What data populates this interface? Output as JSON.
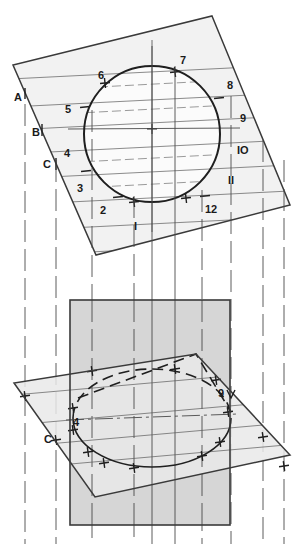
{
  "drawing": {
    "title": "Circle on inclined plane projected to ellipse",
    "canvas": {
      "width": 304,
      "height": 544
    },
    "colors": {
      "outline": "#3a3a3a",
      "thin_line": "#555555",
      "curve": "#222222",
      "fill_light": "#f0f0f0",
      "fill_mid": "#d6d6d6",
      "fill_pale": "#e8e8e8",
      "text": "#1a1a1a",
      "background": "#ffffff"
    },
    "top_view": {
      "name": "inclined-plane-with-circle",
      "plane_vertices": "212,16 290,205 96,255 13,65",
      "circle": {
        "cx": 152,
        "cy": 134,
        "r": 68
      },
      "division_point_labels": [
        {
          "id": "1",
          "text": "I",
          "x": 134,
          "y": 230
        },
        {
          "id": "2",
          "text": "2",
          "x": 100,
          "y": 214
        },
        {
          "id": "3",
          "text": "3",
          "x": 77,
          "y": 192
        },
        {
          "id": "4",
          "text": "4",
          "x": 64,
          "y": 157
        },
        {
          "id": "5",
          "text": "5",
          "x": 65,
          "y": 113
        },
        {
          "id": "6",
          "text": "6",
          "x": 98,
          "y": 79
        },
        {
          "id": "7",
          "text": "7",
          "x": 180,
          "y": 64
        },
        {
          "id": "8",
          "text": "8",
          "x": 227,
          "y": 89
        },
        {
          "id": "9",
          "text": "9",
          "x": 240,
          "y": 122
        },
        {
          "id": "10",
          "text": "IO",
          "x": 237,
          "y": 154
        },
        {
          "id": "11",
          "text": "II",
          "x": 228,
          "y": 184
        },
        {
          "id": "12",
          "text": "12",
          "x": 205,
          "y": 213
        }
      ],
      "edge_labels": [
        {
          "id": "A",
          "text": "A",
          "x": 14,
          "y": 101
        },
        {
          "id": "B",
          "text": "B",
          "x": 32,
          "y": 136
        },
        {
          "id": "C",
          "text": "C",
          "x": 43,
          "y": 168
        }
      ]
    },
    "bottom_view": {
      "name": "front-view-with-ellipse",
      "rectangle": {
        "x": 70,
        "y": 300,
        "width": 160,
        "height": 225
      },
      "plane_vertices": "196,354 290,455 95,497 14,383",
      "ellipse": {
        "cx": 152,
        "cy": 418,
        "rx": 79,
        "ry": 49
      },
      "point_labels": [
        {
          "id": "4",
          "text": "4",
          "x": 73,
          "y": 426
        },
        {
          "id": "9",
          "text": "9",
          "x": 218,
          "y": 397
        },
        {
          "id": "C",
          "text": "C",
          "x": 44,
          "y": 443
        }
      ]
    },
    "projector_count": 9,
    "chord_count": 6
  }
}
